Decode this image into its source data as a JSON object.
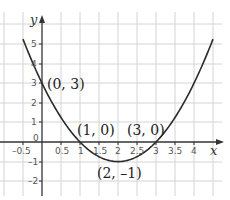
{
  "chart_data": {
    "type": "line",
    "title": "",
    "function": "y = x^2 - 4x + 3",
    "xlabel": "x",
    "ylabel": "y",
    "xlim": [
      -0.75,
      4.75
    ],
    "ylim": [
      -2.8,
      6.4
    ],
    "grid": true,
    "x_ticks": [
      -0.5,
      0.5,
      1,
      1.5,
      2,
      2.5,
      3,
      3.5,
      4
    ],
    "x_tick_labels": [
      "-0.5",
      "0.5",
      "1",
      "1.5",
      "2",
      "2.5",
      "3",
      "3.5",
      "4"
    ],
    "y_ticks": [
      -2,
      -1,
      1,
      2,
      3,
      4,
      5
    ],
    "y_tick_labels": [
      "-2",
      "-1",
      "1",
      "2",
      "3",
      "4",
      "5"
    ],
    "origin_label": "0",
    "series": [
      {
        "name": "parabola",
        "x": [
          -0.5,
          0,
          0.5,
          1,
          1.5,
          2,
          2.5,
          3,
          3.5,
          4,
          4.5
        ],
        "values": [
          5.25,
          3,
          1.25,
          0,
          -0.75,
          -1,
          -0.75,
          0,
          1.25,
          3,
          5.25
        ]
      }
    ],
    "annotations": [
      {
        "label": "(0, 3)",
        "x": 0,
        "y": 3
      },
      {
        "label": "(1, 0)",
        "x": 1,
        "y": 0
      },
      {
        "label": "(3, 0)",
        "x": 3,
        "y": 0
      },
      {
        "label": "(2, –1)",
        "x": 2,
        "y": -1
      }
    ]
  },
  "labels": {
    "x_axis": "x",
    "y_axis": "y",
    "origin": "0",
    "pt_y_intercept": "(0, 3)",
    "pt_root1": "(1, 0)",
    "pt_root2": "(3, 0)",
    "pt_vertex": "(2, –1)",
    "xt_m05": "–0.5",
    "xt_05": "0.5",
    "xt_1": "1",
    "xt_15": "1.5",
    "xt_2": "2",
    "xt_25": "2.5",
    "xt_3": "3",
    "xt_35": "3.5",
    "xt_4": "4",
    "yt_5": "5",
    "yt_4": "4",
    "yt_3": "3",
    "yt_2": "2",
    "yt_1": "1",
    "yt_m1": "–1",
    "yt_m2": "–2"
  },
  "colors": {
    "grid": "#d4d4d4",
    "axis": "#333333",
    "curve": "#2b2b2b"
  }
}
